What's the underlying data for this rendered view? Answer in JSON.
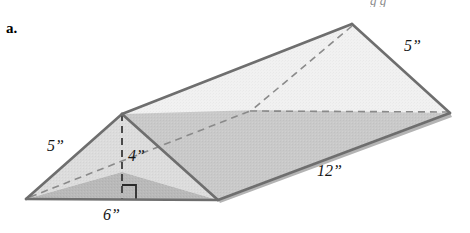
{
  "figure": {
    "part_label": "a.",
    "shape_name": "triangular-prism",
    "colors": {
      "top_face": "#f1f1f1",
      "front_slant_face": "#c9c9c9",
      "left_triangle_upper": "#dcdcdc",
      "left_triangle_lower": "#b9b9b9",
      "outline": "#6e6e6e",
      "hidden_edge": "#8a8a8a",
      "label_text": "#161616",
      "background": "#ffffff"
    },
    "dimensions": [
      {
        "id": "left-slant",
        "value": "5”",
        "number": 5,
        "unit": "inches",
        "x": 47,
        "y": 138
      },
      {
        "id": "height",
        "value": "4”",
        "number": 4,
        "unit": "inches",
        "x": 128,
        "y": 148
      },
      {
        "id": "base",
        "value": "6”",
        "number": 6,
        "unit": "inches",
        "x": 103,
        "y": 207
      },
      {
        "id": "length",
        "value": "12”",
        "number": 12,
        "unit": "inches",
        "x": 317,
        "y": 163
      },
      {
        "id": "right-slant",
        "value": "5”",
        "number": 5,
        "unit": "inches",
        "x": 404,
        "y": 38
      }
    ],
    "vertices": {
      "front_apex": [
        122,
        114
      ],
      "front_bottom_left": [
        26,
        199
      ],
      "front_bottom_right": [
        218,
        200
      ],
      "back_apex": [
        352,
        24
      ],
      "back_bottom_right": [
        450,
        113
      ],
      "hidden_back_left": [
        258,
        110
      ]
    },
    "cut_off_text_top": "g g"
  }
}
